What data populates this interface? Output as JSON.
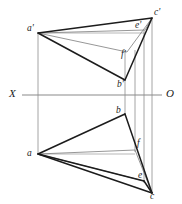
{
  "figure": {
    "kind": "descriptive-geometry-projection",
    "width": 182,
    "height": 204,
    "background_color": "#ffffff",
    "stroke_color_heavy": "#1c1c1c",
    "stroke_color_light": "#8a8a8a",
    "label_color": "#1a1a1a"
  },
  "axis": {
    "name": "ground-line",
    "left_label": "X",
    "right_label": "O",
    "y": 95,
    "x_start": 22,
    "x_end": 162,
    "color": "#8a8a8a"
  },
  "points": {
    "a_prime": {
      "label": "a'",
      "x": 38,
      "y": 33,
      "label_x": 27,
      "label_y": 27
    },
    "c_prime": {
      "label": "c'",
      "x": 152,
      "y": 18,
      "label_x": 154,
      "label_y": 11
    },
    "e_prime": {
      "label": "e'",
      "x": 145,
      "y": 30,
      "label_x": 136,
      "label_y": 25
    },
    "f_prime": {
      "label": "f'",
      "x": 127,
      "y": 52,
      "label_x": 122,
      "label_y": 53
    },
    "b_prime": {
      "label": "b'",
      "x": 125,
      "y": 80,
      "label_x": 118,
      "label_y": 82
    },
    "b": {
      "label": "b",
      "x": 125,
      "y": 114,
      "label_x": 117,
      "label_y": 109
    },
    "f": {
      "label": "f",
      "x": 135,
      "y": 150,
      "label_x": 137,
      "label_y": 142
    },
    "a": {
      "label": "a",
      "x": 38,
      "y": 154,
      "label_x": 28,
      "label_y": 152
    },
    "e": {
      "label": "e",
      "x": 144,
      "y": 181,
      "label_x": 139,
      "label_y": 174
    },
    "c": {
      "label": "c",
      "x": 152,
      "y": 193,
      "label_x": 151,
      "label_y": 194
    }
  },
  "edges_heavy": [
    {
      "name": "edge-aprime-cprime",
      "from": "a_prime",
      "to": "c_prime"
    },
    {
      "name": "edge-aprime-fprime",
      "from": "a_prime",
      "to": "f_prime"
    },
    {
      "name": "edge-aprime-bprime",
      "from": "a_prime",
      "to": "b_prime"
    },
    {
      "name": "edge-bprime-cprime",
      "from": "b_prime",
      "to": "c_prime"
    },
    {
      "name": "edge-a-b",
      "from": "a",
      "to": "b"
    },
    {
      "name": "edge-a-f",
      "from": "a",
      "to": "f"
    },
    {
      "name": "edge-a-c",
      "from": "a",
      "to": "c"
    },
    {
      "name": "edge-b-c",
      "from": "b",
      "to": "c"
    },
    {
      "name": "edge-e-c",
      "from": "e",
      "to": "c"
    }
  ],
  "edges_light": [
    {
      "name": "edge-aprime-eprime",
      "from": "a_prime",
      "to": "e_prime"
    },
    {
      "name": "edge-eprime-cprime",
      "from": "e_prime",
      "to": "c_prime"
    },
    {
      "name": "edge-a-e",
      "from": "a",
      "to": "e"
    },
    {
      "name": "edge-fprime-cprime",
      "from": "f_prime",
      "to": "c_prime"
    }
  ],
  "projection_lines": [
    {
      "name": "projector-a",
      "x1": 38,
      "y1": 33,
      "x2": 38,
      "y2": 154
    },
    {
      "name": "projector-b",
      "x1": 125,
      "y1": 80,
      "x2": 125,
      "y2": 114
    },
    {
      "name": "projector-bp-top",
      "x1": 125,
      "y1": 52,
      "x2": 125,
      "y2": 80
    },
    {
      "name": "projector-f",
      "x1": 135,
      "y1": 52,
      "x2": 135,
      "y2": 150
    },
    {
      "name": "projector-e",
      "x1": 144,
      "y1": 30,
      "x2": 144,
      "y2": 181
    },
    {
      "name": "projector-c",
      "x1": 152,
      "y1": 18,
      "x2": 152,
      "y2": 193
    }
  ],
  "connector_lines": [
    {
      "name": "connector-aprime-eprime-horizontal",
      "x1": 38,
      "y1": 33,
      "x2": 144,
      "y2": 33
    },
    {
      "name": "connector-a-f-horizontal",
      "x1": 38,
      "y1": 154,
      "x2": 135,
      "y2": 154
    }
  ]
}
